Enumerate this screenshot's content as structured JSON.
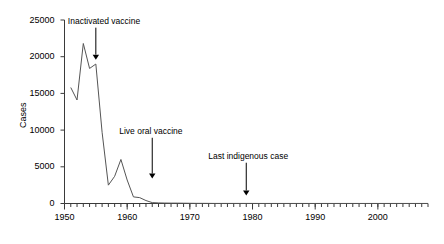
{
  "chart_data": {
    "type": "line",
    "title": "",
    "xlabel": "",
    "ylabel": "Cases",
    "xlim": [
      1950,
      2008
    ],
    "ylim": [
      0,
      25000
    ],
    "grid": false,
    "legend": null,
    "x_ticks": [
      1950,
      1960,
      1970,
      1980,
      1990,
      2000
    ],
    "x_tick_labels": [
      "1950",
      "1960",
      "1970",
      "1980",
      "1990",
      "2000"
    ],
    "x_minor_tick_step": 1,
    "y_ticks": [
      0,
      5000,
      10000,
      15000,
      20000,
      25000
    ],
    "y_tick_labels": [
      "0",
      "5000",
      "10000",
      "15000",
      "20000",
      "25000"
    ],
    "series": [
      {
        "name": "Poliomyelitis cases",
        "color": "#555555",
        "x": [
          1951,
          1952,
          1953,
          1954,
          1955,
          1956,
          1957,
          1958,
          1959,
          1960,
          1961,
          1962,
          1963,
          1964,
          1965,
          1966,
          1967,
          1968,
          1969,
          1970,
          1971,
          1972,
          1973,
          1974,
          1975,
          1976,
          1977,
          1978,
          1979,
          1980,
          1981,
          1982,
          1983,
          1984,
          1985,
          1986,
          1987,
          1988,
          1989,
          1990,
          1991,
          1992,
          1993,
          1994,
          1995,
          1996,
          1997,
          1998,
          1999,
          2000,
          2001,
          2002,
          2003,
          2004,
          2005,
          2006,
          2007,
          2008
        ],
        "y": [
          15800,
          14100,
          21800,
          18400,
          19000,
          9700,
          2500,
          3700,
          6000,
          3200,
          900,
          800,
          400,
          120,
          80,
          60,
          50,
          50,
          40,
          30,
          20,
          20,
          15,
          10,
          10,
          10,
          10,
          10,
          10,
          10,
          5,
          5,
          5,
          5,
          5,
          5,
          5,
          5,
          5,
          5,
          5,
          5,
          5,
          5,
          5,
          5,
          5,
          5,
          5,
          5,
          5,
          5,
          5,
          5,
          5,
          5,
          5,
          5
        ]
      }
    ],
    "annotations": [
      {
        "label": "Inactivated vaccine",
        "x": 1955,
        "arrow_tip_y": 19600,
        "text_y": 24500
      },
      {
        "label": "Live oral vaccine",
        "x": 1964,
        "arrow_tip_y": 3400,
        "text_y": 9500
      },
      {
        "label": "Last indigenous case",
        "x": 1979,
        "arrow_tip_y": 1100,
        "text_y": 6100
      }
    ]
  },
  "axes": {
    "y_axis_label": "Cases"
  }
}
